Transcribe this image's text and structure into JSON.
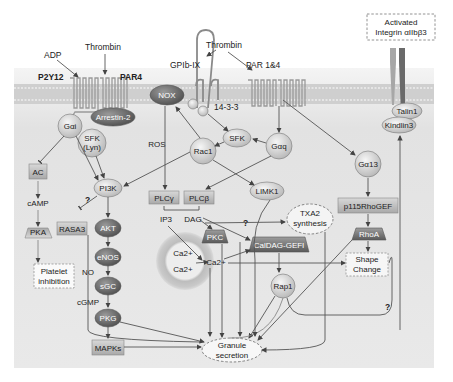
{
  "ligands": {
    "adp": "ADP",
    "thrombin_left": "Thrombin",
    "thrombin_right": "Thrombin"
  },
  "receptors": {
    "p2y12": "P2Y12",
    "par4": "PAR4",
    "gpib_ix": "GPIb-IX",
    "par14": "PAR 1&4",
    "adaptor_1433": "14-3-3"
  },
  "integrin_box": {
    "line1": "Activated",
    "line2": "Integrin αIIbβ3"
  },
  "nodes": {
    "arrestin2": "Arrestin-2",
    "gai": "Gαi",
    "sfk_lyn_1": "SFK",
    "sfk_lyn_2": "(Lyn)",
    "nox": "NOX",
    "ros": "ROS",
    "sfk": "SFK",
    "rac1": "Rac1",
    "gaq": "Gαq",
    "ga13": "Gα13",
    "talin1": "Talin1",
    "kindlin3": "Kindlin3",
    "ac": "AC",
    "camp": "cAMP",
    "pka": "PKA",
    "platelet_inhibition_1": "Platelet",
    "platelet_inhibition_2": "inhibition",
    "pi3k": "PI3K",
    "rasa3": "RASA3",
    "akt": "AKT",
    "enos": "eNOS",
    "no": "NO",
    "sgc": "sGC",
    "cgmp": "cGMP",
    "pkg": "PKG",
    "mapks": "MAPKs",
    "plcg": "PLCγ",
    "plcb": "PLCβ",
    "limk1": "LIMK1",
    "ip3": "IP3",
    "dag": "DAG",
    "txa2_1": "TXA2",
    "txa2_2": "synthesis",
    "pkc": "PKC",
    "caldag": "CalDAG-GEFI",
    "ca_store_1": "Ca2+",
    "ca_store_2": "Ca2+",
    "ca_cyto": "Ca2+",
    "rap1": "Rap1",
    "p115": "p115RhoGEF",
    "rhoa": "RhoA",
    "shape_1": "Shape",
    "shape_2": "Change",
    "granule_1": "Granule",
    "granule_2": "secretion"
  },
  "question_marks": [
    "?",
    "?",
    "?"
  ],
  "colors": {
    "membrane": "#c9c9c9",
    "cytoplasm": "#e4e4e4",
    "node_light": "#d0d0d0",
    "node_dark": "#6e6e6e",
    "line": "#555555"
  }
}
